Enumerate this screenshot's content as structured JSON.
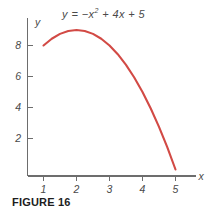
{
  "figure": {
    "caption": "FIGURE 16",
    "equation": {
      "lhs": "y",
      "eq": "= −",
      "base": "x",
      "exponent": "2",
      "rest": "+ 4x + 5",
      "full": "y = −x² + 4x + 5"
    },
    "background_color": "#ffffff"
  },
  "chart_data": {
    "type": "line",
    "title": "",
    "subtitle": "",
    "annotations": [
      {
        "text": "y = −x² + 4x + 5",
        "x": 2.6,
        "y": 10.2,
        "role": "equation-label"
      }
    ],
    "curve_color": "#d24a45",
    "axis_color": "#6d6d6d",
    "grid": false,
    "legend": null,
    "xlabel": "x",
    "ylabel": "y",
    "xlim": [
      0.0,
      5.9
    ],
    "ylim": [
      0.0,
      11.0
    ],
    "xticks": [
      1,
      2,
      3,
      4,
      5
    ],
    "xticklabels": [
      "1",
      "2",
      "3",
      "4",
      "5"
    ],
    "yticks": [
      2,
      4,
      6,
      8
    ],
    "yticklabels": [
      "2",
      "4",
      "6",
      "8"
    ],
    "function": "y = -x^2 + 4x + 5",
    "domain_drawn": [
      1.0,
      5.0
    ],
    "vertex": {
      "x": 2,
      "y": 9
    },
    "x_intercepts": [
      5
    ],
    "series": [
      {
        "name": "y = -x^2 + 4x + 5",
        "x": [
          1.0,
          1.25,
          1.5,
          1.75,
          2.0,
          2.25,
          2.5,
          2.75,
          3.0,
          3.25,
          3.5,
          3.75,
          4.0,
          4.25,
          4.5,
          4.75,
          5.0
        ],
        "values": [
          8.0,
          8.4375,
          8.75,
          8.9375,
          9.0,
          8.9375,
          8.75,
          8.4375,
          8.0,
          7.4375,
          6.75,
          5.9375,
          5.0,
          3.9375,
          2.75,
          1.4375,
          0.0
        ]
      }
    ]
  },
  "labels": {
    "x_axis_name": "x",
    "y_axis_name": "y"
  }
}
